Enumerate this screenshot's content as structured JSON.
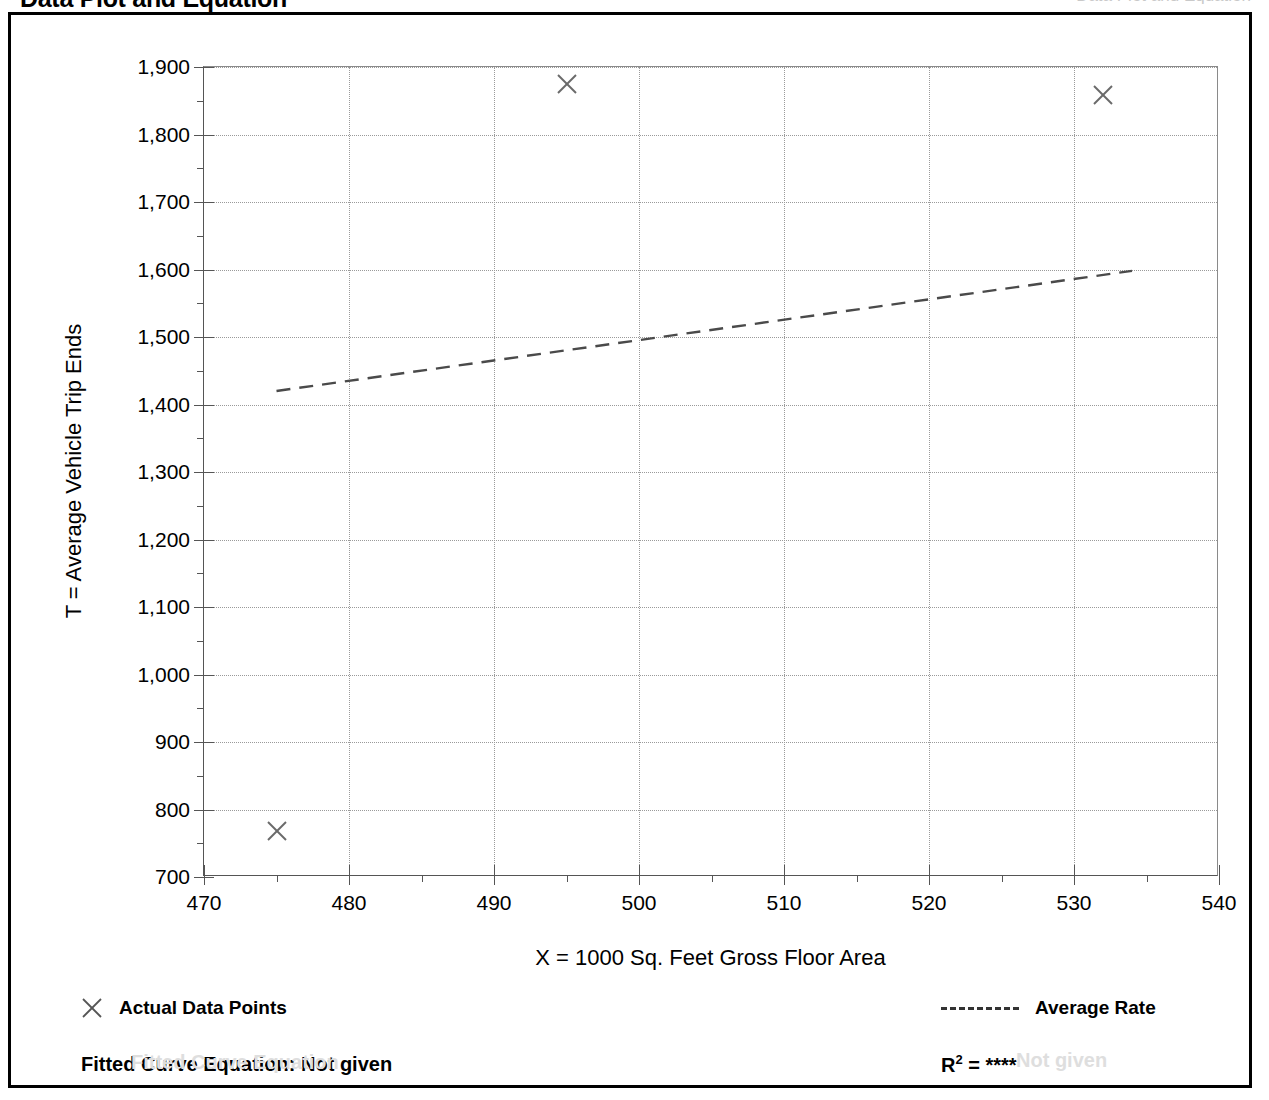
{
  "page": {
    "title": "Data Plot and Equation",
    "title_right_faint": "Data Plot and Equation"
  },
  "chart_data": {
    "type": "scatter",
    "title": "",
    "xlabel": "X = 1000 Sq. Feet Gross Floor Area",
    "ylabel": "T = Average Vehicle Trip Ends",
    "xlim": [
      470,
      540
    ],
    "ylim": [
      700,
      1900
    ],
    "x_major_step": 10,
    "x_minor_step": 5,
    "y_major_step": 100,
    "y_minor_step": 50,
    "grid": true,
    "x_ticks": [
      470,
      480,
      490,
      500,
      510,
      520,
      530,
      540
    ],
    "x_tick_labels": [
      "470",
      "480",
      "490",
      "500",
      "510",
      "520",
      "530",
      "540"
    ],
    "y_ticks": [
      700,
      800,
      900,
      1000,
      1100,
      1200,
      1300,
      1400,
      1500,
      1600,
      1700,
      1800,
      1900
    ],
    "y_tick_labels": [
      "700",
      "800",
      "900",
      "1,000",
      "1,100",
      "1,200",
      "1,300",
      "1,400",
      "1,500",
      "1,600",
      "1,700",
      "1,800",
      "1,900"
    ],
    "series": [
      {
        "name": "Actual Data Points",
        "marker": "x",
        "points": [
          {
            "x": 475,
            "y": 768
          },
          {
            "x": 495,
            "y": 1875
          },
          {
            "x": 532,
            "y": 1858
          }
        ]
      },
      {
        "name": "Average Rate",
        "style": "dashed-line",
        "points": [
          {
            "x": 475,
            "y": 1420
          },
          {
            "x": 534,
            "y": 1598
          }
        ]
      }
    ],
    "legend_position": "below-plot",
    "annotations": {
      "fitted_curve_equation": "Fitted Curve Equation:  Not given",
      "r_squared_label": "R",
      "r_squared_exponent": "2",
      "r_squared_value": "= ****"
    }
  },
  "legend": {
    "actual_data_points": "Actual Data Points",
    "average_rate": "Average Rate"
  },
  "footer": {
    "equation": "Fitted Curve Equation:  Not given",
    "r2_label": "R",
    "r2_sup": "2",
    "r2_value": "= ****",
    "ghost_left": "Fitted Curve Equation",
    "ghost_right": "Not given"
  }
}
